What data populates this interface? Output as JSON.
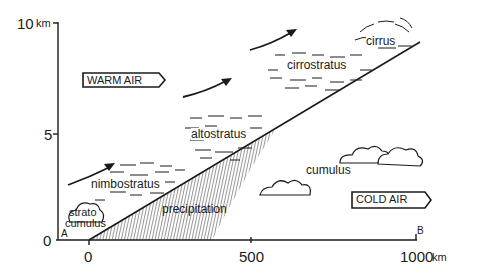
{
  "diagram": {
    "y_axis": {
      "ticks": [
        "0",
        "5",
        "10"
      ],
      "unit": "km"
    },
    "x_axis": {
      "ticks": [
        "0",
        "500",
        "1000"
      ],
      "unit": "km"
    },
    "points": {
      "start": "A",
      "end": "B"
    },
    "air_masses": {
      "warm": "WARM AIR",
      "cold": "COLD AIR"
    },
    "clouds": {
      "cirrus": "cirrus",
      "cirrostratus": "cirrostratus",
      "altostratus": "altostratus",
      "nimbostratus": "nimbostratus",
      "stratocumulus_1": "strato",
      "stratocumulus_2": "cumulus",
      "cumulus": "cumulus"
    },
    "precipitation": "precipitation",
    "colors": {
      "ink": "#1a1a1a",
      "background": "#ffffff"
    }
  }
}
